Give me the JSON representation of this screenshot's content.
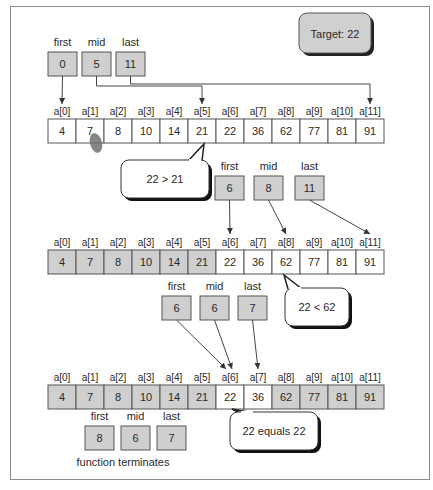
{
  "target": {
    "label": "Target: 22"
  },
  "colors": {
    "gray_fill": "#cfcfcf",
    "white_fill": "#ffffff",
    "stroke": "#555555"
  },
  "pointer_labels": {
    "first": "first",
    "mid": "mid",
    "last": "last"
  },
  "array": {
    "indices": [
      "a[0]",
      "a[1]",
      "a[2]",
      "a[3]",
      "a[4]",
      "a[5]",
      "a[6]",
      "a[7]",
      "a[8]",
      "a[9]",
      "a[10]",
      "a[11]"
    ],
    "values": [
      "4",
      "7",
      "8",
      "10",
      "14",
      "21",
      "22",
      "36",
      "62",
      "77",
      "81",
      "91"
    ]
  },
  "steps": [
    {
      "pointers": {
        "first": "0",
        "mid": "5",
        "last": "11"
      },
      "active_range": [
        0,
        11
      ],
      "comparison": "22 > 21"
    },
    {
      "pointers": {
        "first": "6",
        "mid": "8",
        "last": "11"
      },
      "active_range": [
        6,
        11
      ],
      "comparison": "22 < 62"
    },
    {
      "pointers": {
        "first": "6",
        "mid": "6",
        "last": "7"
      },
      "active_range": [
        6,
        7
      ],
      "comparison": "22 equals 22"
    },
    {
      "pointers": {
        "first": "8",
        "mid": "6",
        "last": "7"
      },
      "caption": "function terminates"
    }
  ]
}
